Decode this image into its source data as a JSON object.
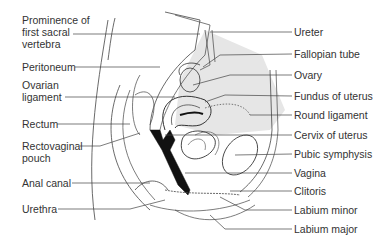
{
  "diagram": {
    "left_labels": [
      {
        "text": "Prominence of",
        "x": 22,
        "y": 20
      },
      {
        "text": "first sacral",
        "x": 22,
        "y": 32
      },
      {
        "text": "vertebra",
        "x": 22,
        "y": 44
      },
      {
        "text": "Peritoneum",
        "x": 22,
        "y": 61
      },
      {
        "text": "Ovarian",
        "x": 22,
        "y": 80
      },
      {
        "text": "ligament",
        "x": 22,
        "y": 93
      },
      {
        "text": "Rectum",
        "x": 22,
        "y": 118
      },
      {
        "text": "Rectovaginal",
        "x": 22,
        "y": 140
      },
      {
        "text": "pouch",
        "x": 22,
        "y": 152
      },
      {
        "text": "Anal canal",
        "x": 22,
        "y": 177
      },
      {
        "text": "Urethra",
        "x": 22,
        "y": 203
      }
    ],
    "right_labels": [
      {
        "text": "Ureter",
        "x": 294,
        "y": 26
      },
      {
        "text": "Fallopian tube",
        "x": 294,
        "y": 48
      },
      {
        "text": "Ovary",
        "x": 294,
        "y": 69
      },
      {
        "text": "Fundus of uterus",
        "x": 294,
        "y": 90
      },
      {
        "text": "Round ligament",
        "x": 294,
        "y": 109
      },
      {
        "text": "Cervix of uterus",
        "x": 294,
        "y": 129
      },
      {
        "text": "Pubic symphysis",
        "x": 294,
        "y": 148
      },
      {
        "text": "Vagina",
        "x": 294,
        "y": 167
      },
      {
        "text": "Clitoris",
        "x": 294,
        "y": 185
      },
      {
        "text": "Labium minor",
        "x": 294,
        "y": 204
      },
      {
        "text": "Labium major",
        "x": 294,
        "y": 223
      }
    ],
    "colors": {
      "line": "#333333",
      "shade": "#e4e4e4",
      "fill_dark": "#111111"
    }
  }
}
